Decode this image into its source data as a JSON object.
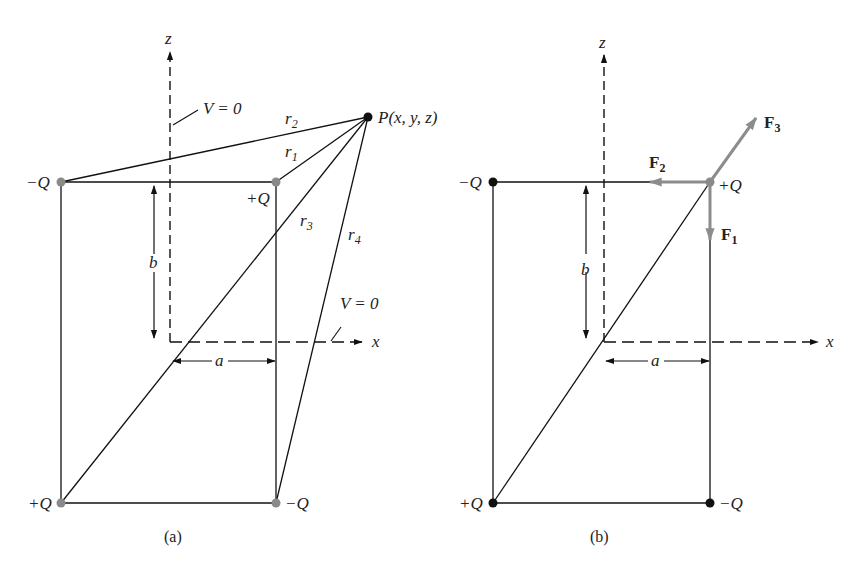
{
  "figure": {
    "panels": [
      {
        "id": "a",
        "caption": "(a)",
        "axes": {
          "z_label": "z",
          "x_label": "x"
        },
        "charges": [
          {
            "label": "−Q",
            "position": "top-left",
            "color": "#8a8a8a"
          },
          {
            "label": "+Q",
            "position": "top-right",
            "color": "#8a8a8a"
          },
          {
            "label": "+Q",
            "position": "bottom-left",
            "color": "#8a8a8a"
          },
          {
            "label": "−Q",
            "position": "bottom-right",
            "color": "#8a8a8a"
          }
        ],
        "point": {
          "label": "P(x, y, z)"
        },
        "distances": {
          "r1": "r",
          "r1_sub": "1",
          "r2": "r",
          "r2_sub": "2",
          "r3": "r",
          "r3_sub": "3",
          "r4": "r",
          "r4_sub": "4"
        },
        "dimensions": {
          "height": "b",
          "width": "a"
        },
        "annotations": {
          "v_zero_plane_z": "V = 0",
          "v_zero_plane_x": "V = 0"
        }
      },
      {
        "id": "b",
        "caption": "(b)",
        "axes": {
          "z_label": "z",
          "x_label": "x"
        },
        "charges": [
          {
            "label": "−Q",
            "position": "top-left",
            "color": "#111111"
          },
          {
            "label": "+Q",
            "position": "top-right",
            "color": "#8a8a8a"
          },
          {
            "label": "+Q",
            "position": "bottom-left",
            "color": "#111111"
          },
          {
            "label": "−Q",
            "position": "bottom-right",
            "color": "#111111"
          }
        ],
        "forces": {
          "f1": "F",
          "f1_sub": "1",
          "f2": "F",
          "f2_sub": "2",
          "f3": "F",
          "f3_sub": "3",
          "color": "#8c8c8c"
        },
        "dimensions": {
          "height": "b",
          "width": "a"
        }
      }
    ]
  }
}
